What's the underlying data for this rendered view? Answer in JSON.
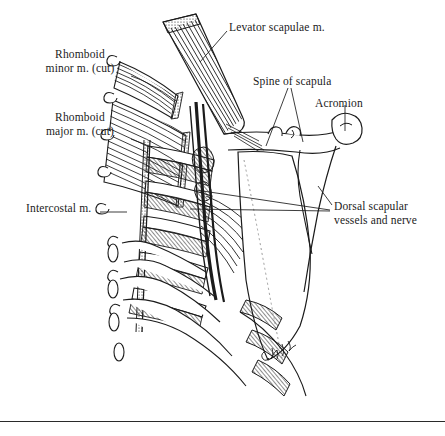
{
  "figure": {
    "kind": "anatomical-line-drawing",
    "background_color": "#ffffff",
    "ink_color": "#1b1b1b",
    "signature": "artist signature (cursive, illegible)"
  },
  "labels": {
    "rhomboid_minor": "Rhomboid\nminor m. (cut)",
    "rhomboid_major": "Rhomboid\nmajor m. (cut)",
    "intercostal": "Intercostal m.",
    "levator_scapulae": "Levator scapulae m.",
    "spine_of_scapula": "Spine of scapula",
    "acromion": "Acromion",
    "dorsal_scapular": "Dorsal scapular\nvessels and nerve"
  },
  "structures": [
    {
      "name": "levator-scapulae-muscle",
      "description": "striated band, cut end, upper center"
    },
    {
      "name": "rhomboid-minor-muscle",
      "description": "cut striated fibers, upper left"
    },
    {
      "name": "rhomboid-major-muscle",
      "description": "cut striated fibers, mid left"
    },
    {
      "name": "intercostal-muscles",
      "description": "hatched muscle between ribs"
    },
    {
      "name": "ribs",
      "description": "curved rib shafts"
    },
    {
      "name": "vertebral-spinous-processes",
      "description": "hook shapes along left margin"
    },
    {
      "name": "scapula-bone",
      "description": "flat blade with spine and acromion, right"
    },
    {
      "name": "scapular-spine",
      "description": "ridge across upper scapula"
    },
    {
      "name": "acromion-process",
      "description": "hooked lateral end of scapular spine"
    },
    {
      "name": "dorsal-scapular-vessels-and-nerve",
      "description": "dark bundle along medial scapular border"
    }
  ]
}
